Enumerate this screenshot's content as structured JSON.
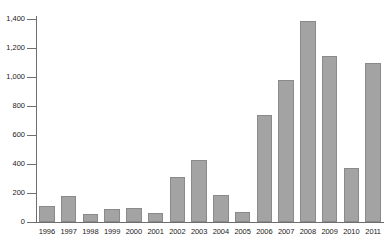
{
  "chart_data": {
    "type": "bar",
    "title": "",
    "xlabel": "",
    "ylabel": "",
    "categories": [
      "1996",
      "1997",
      "1998",
      "1999",
      "2000",
      "2001",
      "2002",
      "2003",
      "2004",
      "2005",
      "2006",
      "2007",
      "2008",
      "2009",
      "2010",
      "2011"
    ],
    "values": [
      110,
      177,
      55,
      90,
      95,
      63,
      310,
      428,
      185,
      70,
      737,
      978,
      1385,
      1145,
      372,
      1095
    ],
    "ylim": [
      0,
      1400
    ],
    "yticks": [
      0,
      200,
      400,
      600,
      800,
      1000,
      1200,
      1400
    ],
    "ytick_labels": [
      "0",
      "200",
      "400",
      "600",
      "800",
      "1,000",
      "1,200",
      "1,400"
    ],
    "grid": false,
    "legend": null,
    "series": [
      {
        "name": "",
        "values": [
          110,
          177,
          55,
          90,
          95,
          63,
          310,
          428,
          185,
          70,
          737,
          978,
          1385,
          1145,
          372,
          1095
        ]
      }
    ],
    "colors": {
      "bar_fill": "#a3a3a3",
      "bar_border": "#8a8a8a",
      "axis": "#6e6e6e",
      "text": "#1a1a1a",
      "background": "#ffffff"
    }
  }
}
